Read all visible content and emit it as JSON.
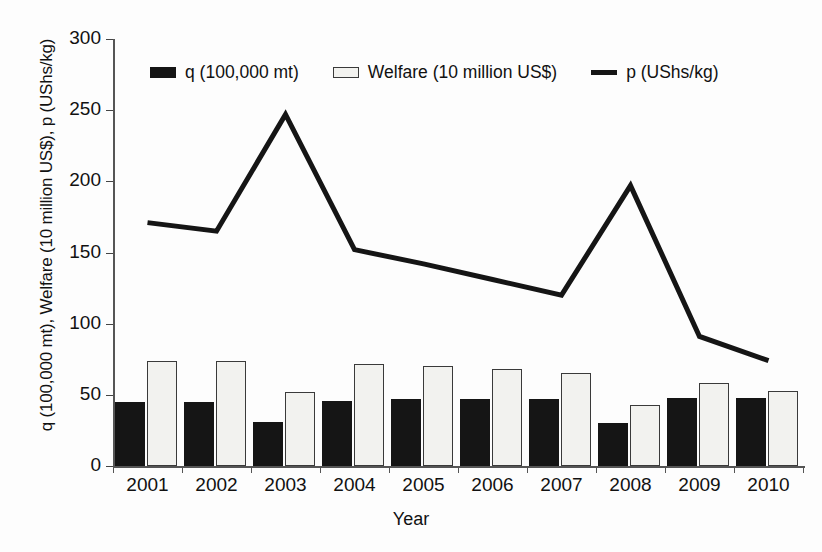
{
  "chart_data": {
    "type": "bar",
    "title": "",
    "subtitle": "",
    "xlabel": "Year",
    "ylabel": "q (100,000 mt), Welfare (10 million US$), p (UShs/kg)",
    "categories": [
      "2001",
      "2002",
      "2003",
      "2004",
      "2005",
      "2006",
      "2007",
      "2008",
      "2009",
      "2010"
    ],
    "ylim": [
      0,
      300
    ],
    "yticks": [
      0,
      50,
      100,
      150,
      200,
      250,
      300
    ],
    "grid": false,
    "legend_position": "top-center",
    "series": [
      {
        "name": "q (100,000 mt)",
        "type": "bar",
        "color": "#151515",
        "values": [
          45,
          45,
          31,
          46,
          47,
          47,
          47,
          30,
          48,
          48
        ]
      },
      {
        "name": "Welfare (10 million US$)",
        "type": "bar",
        "color": "#f2f2ef",
        "edge_color": "#3a3a3a",
        "values": [
          74,
          74,
          52,
          72,
          70,
          68,
          65,
          43,
          58,
          53
        ]
      },
      {
        "name": "p (UShs/kg)",
        "type": "line",
        "color": "#151515",
        "values": [
          171,
          165,
          247,
          152,
          142,
          131,
          120,
          197,
          91,
          74
        ]
      }
    ]
  },
  "legend": {
    "items": [
      {
        "label": "q (100,000 mt)",
        "marker": "filled-square-swatch"
      },
      {
        "label": "Welfare (10 million US$)",
        "marker": "outlined-square-swatch"
      },
      {
        "label": "p (UShs/kg)",
        "marker": "line-swatch"
      }
    ]
  },
  "axes": {
    "y_title": "q (100,000 mt), Welfare (10 million US$), p (UShs/kg)",
    "x_title": "Year",
    "y_tick_labels": [
      "300",
      "250",
      "200",
      "150",
      "100",
      "50",
      "0"
    ],
    "x_tick_labels": [
      "2001",
      "2002",
      "2003",
      "2004",
      "2005",
      "2006",
      "2007",
      "2008",
      "2009",
      "2010"
    ]
  },
  "colors": {
    "q_bar": "#151515",
    "welfare_bar": "#f2f2ef",
    "welfare_bar_edge": "#3a3a3a",
    "price_line": "#151515",
    "axis": "#555555",
    "background": "#fdfdfd"
  }
}
